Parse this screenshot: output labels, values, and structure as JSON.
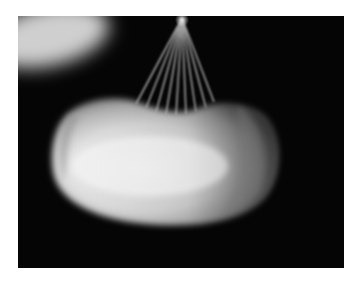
{
  "image": {
    "description": "Grayscale photograph of a glowing kidney-bean shaped object suspended by converging strings against a black background",
    "colors": {
      "page_background": "#ffffff",
      "frame_background": "#050505",
      "bean_highlight": "#f4f4f4",
      "bean_edge": "#9a9a9a",
      "string": "#bdbdbd",
      "blur_blob": "#cfcfcf"
    }
  }
}
